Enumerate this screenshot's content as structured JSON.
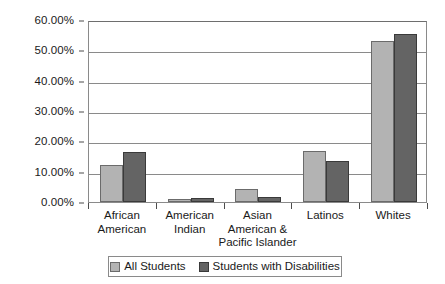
{
  "chart_data": {
    "type": "bar",
    "title": "",
    "xlabel": "",
    "ylabel": "",
    "ylim": [
      0,
      60
    ],
    "ytick_labels": [
      "0.00%",
      "10.00%",
      "20.00%",
      "30.00%",
      "40.00%",
      "50.00%",
      "60.00%"
    ],
    "ytick_values": [
      0,
      10,
      20,
      30,
      40,
      50,
      60
    ],
    "grid": true,
    "legend_position": "bottom",
    "categories": [
      "African American",
      "American Indian",
      "Asian American & Pacific Islander",
      "Latinos",
      "Whites"
    ],
    "category_lines": [
      [
        "African",
        "American"
      ],
      [
        "American",
        "Indian"
      ],
      [
        "Asian",
        "American &",
        "Pacific Islander"
      ],
      [
        "Latinos"
      ],
      [
        "Whites"
      ]
    ],
    "series": [
      {
        "name": "All Students",
        "color": "#b3b3b3",
        "values": [
          12.2,
          1.0,
          4.3,
          16.8,
          53.0
        ]
      },
      {
        "name": "Students with Disabilities",
        "color": "#646464",
        "values": [
          16.4,
          1.2,
          1.8,
          13.5,
          55.5
        ]
      }
    ]
  },
  "legend": {
    "entries": [
      {
        "label": "All Students"
      },
      {
        "label": "Students with Disabilities"
      }
    ]
  }
}
